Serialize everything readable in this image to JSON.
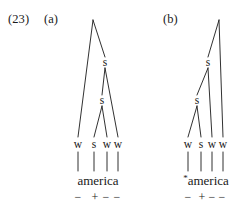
{
  "figure": {
    "example_number": "(23)",
    "ink_color": "#1a1a1a",
    "background_color": "#ffffff"
  },
  "trees": [
    {
      "id": "a",
      "label": "(a)",
      "word": "america",
      "word_prefix": "",
      "grammatical": true,
      "terminals": [
        {
          "label": "w",
          "feature": "−"
        },
        {
          "label": "s",
          "feature": "+"
        },
        {
          "label": "w",
          "feature": "−"
        },
        {
          "label": "w",
          "feature": "−"
        }
      ],
      "internal_nodes": [
        {
          "label": "",
          "level": "root"
        },
        {
          "label": "s",
          "level": "upper"
        },
        {
          "label": "s",
          "level": "lower"
        }
      ]
    },
    {
      "id": "b",
      "label": "(b)",
      "word": "america",
      "word_prefix": "*",
      "grammatical": false,
      "terminals": [
        {
          "label": "w",
          "feature": "−"
        },
        {
          "label": "s",
          "feature": "+"
        },
        {
          "label": "w",
          "feature": "−"
        },
        {
          "label": "w",
          "feature": "−"
        }
      ],
      "internal_nodes": [
        {
          "label": "",
          "level": "root"
        },
        {
          "label": "s",
          "level": "upper"
        },
        {
          "label": "s",
          "level": "lower"
        }
      ]
    }
  ]
}
